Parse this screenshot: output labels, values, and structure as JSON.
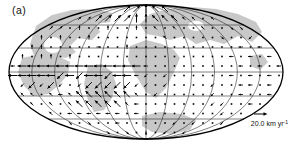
{
  "figure": {
    "label": "(a)"
  },
  "scale_bar": {
    "text": "20.0 km yr",
    "exponent": "-1",
    "arrow_length_px": 11
  },
  "colors": {
    "background": "#ffffff",
    "shaded_land": "#c8c8c8",
    "graticule": "#1c1c1c",
    "outline": "#000000",
    "arrows": "#000000"
  },
  "projection": {
    "type": "mollweide",
    "cx": 146,
    "cy": 72,
    "rx": 137,
    "ry": 67
  },
  "graticule": {
    "parallel_offsets": [
      -47,
      -24,
      0,
      24,
      47
    ],
    "meridian_fractions": [
      0.1667,
      0.3333,
      0.5,
      0.6667,
      0.8333
    ],
    "central_meridian": true
  },
  "shaded_regions": [
    {
      "name": "landmass-northwest",
      "d": "M30,44 L36,26 L52,15 L72,10 L96,9 L112,13 L110,22 L96,24 L100,32 L92,40 L78,38 L70,46 L76,52 L66,58 L52,56 L44,60 L34,56 Z"
    },
    {
      "name": "landmass-west-mid",
      "d": "M22,58 L40,54 L58,56 L70,62 L68,74 L60,84 L48,94 L34,96 L24,86 L18,72 Z"
    },
    {
      "name": "landmass-south-america",
      "d": "M88,66 L102,64 L112,72 L116,84 L112,98 L104,110 L94,112 L88,100 L84,84 Z"
    },
    {
      "name": "landmass-eurasia",
      "d": "M140,24 L150,14 L168,9 L192,7 L216,9 L238,14 L256,22 L262,32 L252,42 L238,36 L224,44 L210,40 L196,44 L184,36 L170,40 L158,36 L146,34 Z"
    },
    {
      "name": "landmass-africa",
      "d": "M130,46 L146,40 L162,44 L174,50 L180,58 L174,72 L166,88 L156,98 L146,92 L136,76 L128,60 Z"
    },
    {
      "name": "shaded-region-south-center",
      "d": "M142,116 L160,112 L182,114 L196,120 L190,130 L172,134 L152,132 L142,126 Z"
    },
    {
      "name": "shaded-region-east",
      "d": "M250,56 L262,54 L268,62 L260,70 L250,66 Z"
    }
  ],
  "white_patches": [
    {
      "name": "ocean-gap-1",
      "cx": 53,
      "cy": 45,
      "rx": 9,
      "ry": 8
    },
    {
      "name": "ocean-gap-2",
      "cx": 196,
      "cy": 26,
      "rx": 8,
      "ry": 5
    }
  ],
  "vector_field": {
    "x0": 13,
    "y0": 9,
    "dx": 9.5,
    "dy": 9.5,
    "cols": 29,
    "len_large": 9,
    "len_small": 4.5,
    "dot_size": 1.6,
    "code_map": {
      "n": "north",
      "s": "south",
      "e": "east",
      "w": "west",
      "p": "northeast",
      "q": "northwest",
      "z": "southwest",
      "x": "southeast",
      ".": "near-zero vector (dot)",
      " ": "outside map",
      "uppercase": "large magnitude (~20 km/yr)",
      "lowercase": "small magnitude"
    },
    "rows": [
      "            PPNQQ            ",
      "       ppPPPPNNQQQqq.q       ",
      "    pp.n..n..n.q.q..q..xx    ",
      "   n.n..n.......q.....x..z   ",
      "  nn.....e..n...........w.w  ",
      " n.nn.n................w.w.w ",
      "wWWWWWWWWWWWWWw.........w.w.w",
      "WWWWWZWZWWZWWwz.z......w.w.w.",
      " zZzZz.zZZZZZzz.z....z..ww.w ",
      " qq.qwqQQQQQQq.z.....z..w..w ",
      "  q.q.qQQQQQqw.......zz..w.  ",
      "    q.wwwwww.w........z..    ",
      "      x.x..w.....z.z..z      ",
      "          x.x.s.z.z          "
    ]
  }
}
